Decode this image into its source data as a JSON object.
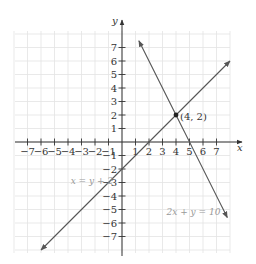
{
  "chart_data": {
    "type": "line",
    "title": "",
    "xlabel": "x",
    "ylabel": "y",
    "xlim": [
      -8,
      8
    ],
    "ylim": [
      -8,
      8
    ],
    "grid": true,
    "x_ticks": [
      -7,
      -6,
      -5,
      -4,
      -3,
      -2,
      -1,
      1,
      2,
      3,
      4,
      5,
      6,
      7
    ],
    "y_ticks": [
      -7,
      -6,
      -5,
      -4,
      -3,
      -2,
      -1,
      1,
      2,
      3,
      4,
      5,
      6,
      7
    ],
    "series": [
      {
        "name": "x = y + 2",
        "equation": "y = x - 2",
        "points": [
          [
            -6,
            -8
          ],
          [
            8,
            6
          ]
        ],
        "label_position": [
          -3.8,
          -3.1
        ]
      },
      {
        "name": "2x + y = 10",
        "equation": "y = 10 - 2x",
        "points": [
          [
            1.25,
            7.5
          ],
          [
            7.8,
            -5.6
          ]
        ],
        "label_position": [
          3.3,
          -5.4
        ]
      }
    ],
    "annotations": [
      {
        "text": "(4, 2)",
        "point": [
          4,
          2
        ]
      }
    ]
  },
  "labels": {
    "x_axis": "x",
    "y_axis": "y",
    "line1": "x = y + 2",
    "line2": "2x + y = 10",
    "intersection": "(4, 2)"
  },
  "colors": {
    "grid": "#e3e3e3",
    "axis": "#333333",
    "line": "#555555",
    "label": "#999999",
    "text": "#333333"
  }
}
